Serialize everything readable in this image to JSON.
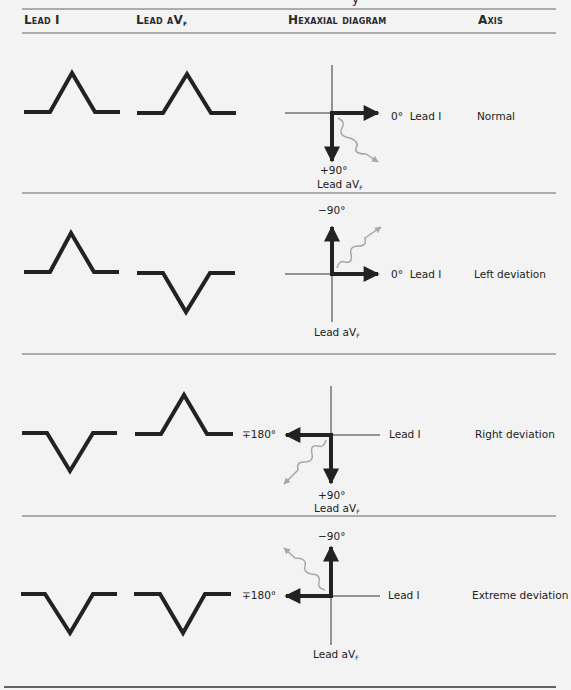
{
  "header": {
    "cutoff_fragment": "y",
    "columns": [
      "Lead I",
      "Lead aVF",
      "Hexaxial diagram",
      "Axis"
    ]
  },
  "labels": {
    "zero": "0°",
    "lead_i": "Lead I",
    "lead_avf_prefix": "Lead aV",
    "lead_avf_sub": "F",
    "plus90": "+90°",
    "minus90": "−90°",
    "minus_plus_180": "∓180°"
  },
  "rows": [
    {
      "lead_i": "positive",
      "lead_avf": "positive",
      "axis": "Normal"
    },
    {
      "lead_i": "positive",
      "lead_avf": "negative",
      "axis": "Left deviation"
    },
    {
      "lead_i": "negative",
      "lead_avf": "positive",
      "axis": "Right deviation"
    },
    {
      "lead_i": "negative",
      "lead_avf": "negative",
      "axis": "Extreme deviation"
    }
  ],
  "colors": {
    "ink": "#222222",
    "arrow_grey": "#a8a8a8",
    "rule": "#555555",
    "background": "#f3f3f3"
  }
}
